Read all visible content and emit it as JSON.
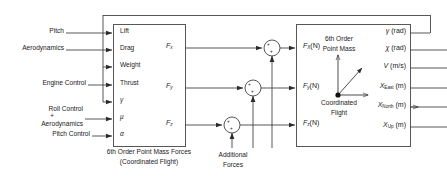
{
  "diagram": {
    "line_color": "#3a3a3a",
    "text_color": "#1a1a1a",
    "background": "#ffffff"
  },
  "inputs": [
    {
      "label": "Pitch"
    },
    {
      "label": "Aerodynamics"
    },
    {
      "label": "Engine Control"
    },
    {
      "label": "Roll Control"
    },
    {
      "label": "+"
    },
    {
      "label": "Aerodynamics"
    },
    {
      "label": "Pitch Control"
    }
  ],
  "forces_block": {
    "caption_line1": "6th Order Point Mass Forces",
    "caption_line2": "(Coordinated Flight)",
    "input_ports": [
      {
        "name": "Lift"
      },
      {
        "name": "Drag"
      },
      {
        "name": "Weight"
      },
      {
        "name": "Thrust"
      },
      {
        "name": "γ"
      },
      {
        "name": "μ"
      },
      {
        "name": "α"
      }
    ],
    "output_ports": [
      {
        "base": "F",
        "sub": "x"
      },
      {
        "base": "F",
        "sub": "y"
      },
      {
        "base": "F",
        "sub": "z"
      }
    ]
  },
  "sum_junctions": [
    {
      "name": "sum-fx",
      "signs": [
        "+",
        "+"
      ]
    },
    {
      "name": "sum-fy",
      "signs": [
        "+",
        "+"
      ]
    },
    {
      "name": "sum-fz",
      "signs": [
        "+",
        "+"
      ]
    }
  ],
  "additional_forces": {
    "line1": "Additional",
    "line2": "Forces"
  },
  "dynamics_block": {
    "icon_label_line1": "6th Order",
    "icon_label_line2": "Point Mass",
    "icon_caption_line1": "Coordinated",
    "icon_caption_line2": "Flight",
    "input_ports": [
      {
        "base": "F",
        "sub": "X",
        "unit": "(N)"
      },
      {
        "base": "F",
        "sub": "y",
        "unit": "(N)"
      },
      {
        "base": "F",
        "sub": "z",
        "unit": "(N)"
      }
    ],
    "output_ports": [
      {
        "base": "γ",
        "sub": "",
        "unit": "(rad)"
      },
      {
        "base": "χ",
        "sub": "",
        "unit": "(rad)"
      },
      {
        "base": "V",
        "sub": "",
        "unit": "(m/s)"
      },
      {
        "base": "X",
        "sub": "East",
        "unit": "(m)"
      },
      {
        "base": "X",
        "sub": "North",
        "unit": "(m)"
      },
      {
        "base": "X",
        "sub": "Up",
        "unit": "(m)"
      }
    ]
  }
}
